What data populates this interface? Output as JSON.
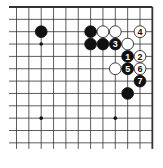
{
  "diagram": {
    "type": "go-board-diagram",
    "visible_columns": 12,
    "visible_rows": 12,
    "edges": {
      "top": true,
      "right": true,
      "left": false,
      "bottom": false
    },
    "colors": {
      "line": "#333333",
      "black_stone": "#111111",
      "white_stone": "#ffffff",
      "background": "#ffffff"
    },
    "star_points": [
      {
        "col": 2,
        "row": 3
      },
      {
        "col": 2,
        "row": 9
      },
      {
        "col": 8,
        "row": 9
      }
    ],
    "stones": [
      {
        "col": 2,
        "row": 2,
        "color": "black",
        "label": ""
      },
      {
        "col": 6,
        "row": 2,
        "color": "black",
        "label": ""
      },
      {
        "col": 7,
        "row": 2,
        "color": "white",
        "label": ""
      },
      {
        "col": 8,
        "row": 2,
        "color": "white",
        "label": ""
      },
      {
        "col": 10,
        "row": 2,
        "color": "white",
        "label": "4"
      },
      {
        "col": 6,
        "row": 3,
        "color": "black",
        "label": ""
      },
      {
        "col": 7,
        "row": 3,
        "color": "black",
        "label": ""
      },
      {
        "col": 8,
        "row": 3,
        "color": "black",
        "label": "3"
      },
      {
        "col": 9,
        "row": 3,
        "color": "white",
        "label": ""
      },
      {
        "col": 9,
        "row": 4,
        "color": "black",
        "label": "1"
      },
      {
        "col": 10,
        "row": 4,
        "color": "white",
        "label": "2"
      },
      {
        "col": 8,
        "row": 5,
        "color": "white",
        "label": ""
      },
      {
        "col": 9,
        "row": 5,
        "color": "black",
        "label": "5"
      },
      {
        "col": 10,
        "row": 5,
        "color": "white",
        "label": "6"
      },
      {
        "col": 10,
        "row": 6,
        "color": "black",
        "label": "7"
      },
      {
        "col": 9,
        "row": 7,
        "color": "black",
        "label": ""
      }
    ]
  }
}
